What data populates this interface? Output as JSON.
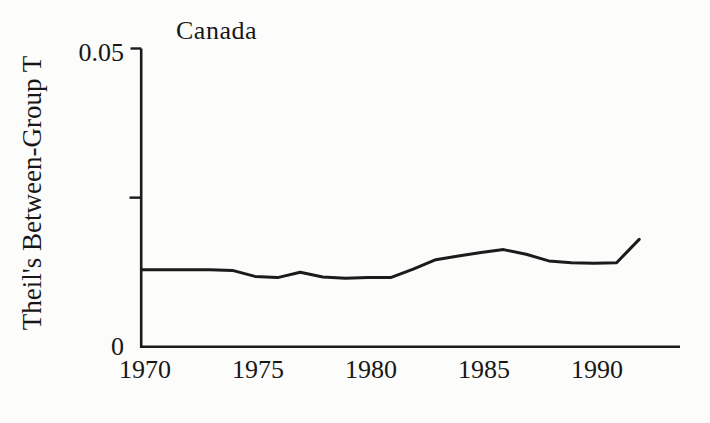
{
  "chart_data": {
    "type": "line",
    "title": "Canada",
    "ylabel": "Theil's Between-Group T",
    "xlabel": "",
    "x": [
      1970,
      1971,
      1972,
      1973,
      1974,
      1975,
      1976,
      1977,
      1978,
      1979,
      1980,
      1981,
      1982,
      1983,
      1984,
      1985,
      1986,
      1987,
      1988,
      1989,
      1990,
      1991,
      1992
    ],
    "series": [
      {
        "name": "Theil's Between-Group T (Canada)",
        "values": [
          0.0129,
          0.0129,
          0.0129,
          0.0129,
          0.0128,
          0.0118,
          0.0116,
          0.0125,
          0.0117,
          0.0115,
          0.0116,
          0.0116,
          0.013,
          0.0146,
          0.0152,
          0.0158,
          0.0163,
          0.0155,
          0.0144,
          0.0141,
          0.014,
          0.0141,
          0.018
        ]
      }
    ],
    "ylim": [
      0,
      0.05
    ],
    "xlim": [
      1970,
      1993.8
    ],
    "x_ticks": [
      1970,
      1975,
      1980,
      1985,
      1990
    ],
    "y_ticks": [
      {
        "value": 0.05,
        "label": "0.05"
      },
      {
        "value": 0.025,
        "label": ""
      },
      {
        "value": 0,
        "label": "0"
      }
    ],
    "grid": false,
    "legend": false,
    "line_color": "#1b1b1b",
    "axis_color": "#1b1b1b"
  }
}
